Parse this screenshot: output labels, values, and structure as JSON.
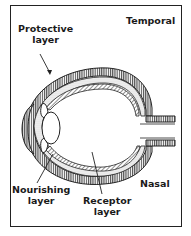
{
  "diagram": {
    "title": "",
    "labels": {
      "protective": [
        "Protective",
        "layer"
      ],
      "temporal": "Temporal",
      "nourishing": [
        "Nourishing",
        "layer"
      ],
      "receptor": [
        "Receptor",
        "layer"
      ],
      "nasal": "Nasal"
    }
  }
}
